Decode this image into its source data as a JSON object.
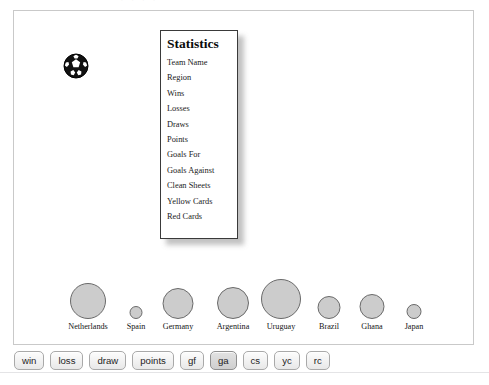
{
  "page": {
    "clipped_top_text": "· · · ·"
  },
  "canvas": {
    "ball_icon": "soccer-ball-icon"
  },
  "stats_panel": {
    "title": "Statistics",
    "items": [
      "Team Name",
      "Region",
      "Wins",
      "Losses",
      "Draws",
      "Points",
      "Goals For",
      "Goals Against",
      "Clean Sheets",
      "Yellow Cards",
      "Red Cards"
    ]
  },
  "chart_data": {
    "type": "scatter",
    "title": "",
    "xlabel": "",
    "ylabel": "",
    "categories": [
      "Netherlands",
      "Spain",
      "Germany",
      "Argentina",
      "Uruguay",
      "Brazil",
      "Ghana",
      "Japan"
    ],
    "values": [
      36,
      13,
      31,
      32,
      40,
      23,
      25,
      15
    ],
    "value_label": "Goals Against (bubble diameter, px)",
    "legend": [],
    "grid": false,
    "bubbles": [
      {
        "label": "Netherlands",
        "size": 36,
        "center_x": 60
      },
      {
        "label": "Spain",
        "size": 13,
        "center_x": 108
      },
      {
        "label": "Germany",
        "size": 31,
        "center_x": 150
      },
      {
        "label": "Argentina",
        "size": 32,
        "center_x": 205
      },
      {
        "label": "Uruguay",
        "size": 40,
        "center_x": 253
      },
      {
        "label": "Brazil",
        "size": 23,
        "center_x": 301
      },
      {
        "label": "Ghana",
        "size": 25,
        "center_x": 344
      },
      {
        "label": "Japan",
        "size": 15,
        "center_x": 386
      }
    ]
  },
  "toolbar": {
    "buttons": [
      {
        "label": "win",
        "pressed": false
      },
      {
        "label": "loss",
        "pressed": false
      },
      {
        "label": "draw",
        "pressed": false
      },
      {
        "label": "points",
        "pressed": false
      },
      {
        "label": "gf",
        "pressed": false
      },
      {
        "label": "ga",
        "pressed": true
      },
      {
        "label": "cs",
        "pressed": false
      },
      {
        "label": "yc",
        "pressed": false
      },
      {
        "label": "rc",
        "pressed": false
      }
    ]
  },
  "colors": {
    "bubble_fill": "#cccccc",
    "bubble_stroke": "#6a6a6a",
    "panel_border": "#3a3a3a",
    "canvas_border": "#c9c9c9"
  }
}
